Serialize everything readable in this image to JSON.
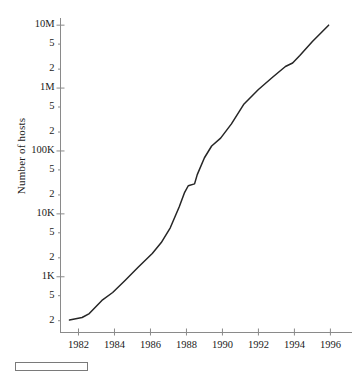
{
  "chart_data": {
    "type": "line",
    "title": "",
    "subtitle": "",
    "xlabel": "",
    "ylabel": "Number of hosts",
    "yscale": "log",
    "xscale": "linear",
    "grid": false,
    "legend": "none",
    "xlim": [
      1981.0,
      1997.2
    ],
    "ylim": [
      130,
      13000000
    ],
    "xticks": [
      1982,
      1984,
      1986,
      1988,
      1990,
      1992,
      1994,
      1996
    ],
    "xtick_labels": [
      "1982",
      "1984",
      "1986",
      "1988",
      "1990",
      "1992",
      "1994",
      "1996"
    ],
    "yticks": [
      200,
      500,
      1000,
      2000,
      5000,
      10000,
      20000,
      50000,
      100000,
      200000,
      500000,
      1000000,
      2000000,
      5000000,
      10000000
    ],
    "ytick_labels": [
      "2",
      "5",
      "1K",
      "2",
      "5",
      "10K",
      "2",
      "5",
      "100K",
      "2",
      "5",
      "1M",
      "2",
      "5",
      "10M"
    ],
    "ymajor_ticks": [
      1000,
      10000,
      100000,
      1000000,
      10000000
    ],
    "ymajor_labels": [
      "1K",
      "10K",
      "100K",
      "1M",
      "10M"
    ],
    "series": [
      {
        "name": "Internet hosts",
        "color": "#262626",
        "x": [
          1981.5,
          1982.2,
          1982.6,
          1983.3,
          1983.9,
          1984.6,
          1985.3,
          1986.1,
          1986.6,
          1987.1,
          1987.6,
          1987.9,
          1988.1,
          1988.45,
          1988.6,
          1989.0,
          1989.4,
          1989.9,
          1990.5,
          1991.2,
          1992.0,
          1992.8,
          1993.5,
          1993.9,
          1994.3,
          1995.0,
          1995.9
        ],
        "y": [
          205,
          225,
          260,
          420,
          562,
          880,
          1400,
          2350,
          3500,
          6000,
          13000,
          22000,
          28000,
          30000,
          42000,
          78000,
          120000,
          160000,
          270000,
          560000,
          950000,
          1500000,
          2200000,
          2500000,
          3300000,
          5500000,
          10000000
        ]
      }
    ]
  },
  "axis": {
    "ylabel": "Number of hosts"
  },
  "legend_bar": {
    "name": "scale-bar",
    "color": "#ffffff",
    "border_color": "#7a7a7a"
  }
}
